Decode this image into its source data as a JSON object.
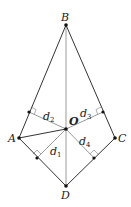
{
  "diagram": {
    "type": "quadrilateral-with-perpendiculars",
    "colors": {
      "edge": "#333333",
      "aux": "#9a9a9a",
      "point": "#111111"
    },
    "points": {
      "A": {
        "label": "A",
        "x": 19,
        "y": 138,
        "lx": 8,
        "ly": 142
      },
      "B": {
        "label": "B",
        "x": 66,
        "y": 25,
        "lx": 61,
        "ly": 21
      },
      "C": {
        "label": "C",
        "x": 115,
        "y": 138,
        "lx": 118,
        "ly": 142
      },
      "D": {
        "label": "D",
        "x": 66,
        "y": 186,
        "lx": 61,
        "ly": 199
      },
      "O": {
        "label": "O",
        "x": 66,
        "y": 129,
        "lx": 69,
        "ly": 125
      }
    },
    "feet": [
      {
        "on": "AB",
        "x": 29,
        "y": 112
      },
      {
        "on": "BC",
        "x": 103,
        "y": 112
      },
      {
        "on": "AD",
        "x": 37,
        "y": 158
      },
      {
        "on": "CD",
        "x": 94,
        "y": 158
      }
    ],
    "distances": [
      {
        "label": "d",
        "sub": "1",
        "x": 50,
        "y": 155
      },
      {
        "label": "d",
        "sub": "2",
        "x": 43,
        "y": 120
      },
      {
        "label": "d",
        "sub": "3",
        "x": 80,
        "y": 117
      },
      {
        "label": "d",
        "sub": "4",
        "x": 79,
        "y": 145
      }
    ]
  }
}
